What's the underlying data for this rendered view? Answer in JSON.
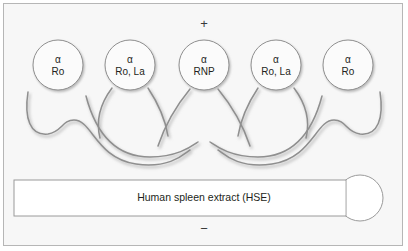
{
  "figure": {
    "title_sign_top": "+",
    "title_sign_bottom": "−",
    "background_color": "#f7f7f7",
    "border_color": "#b6b6b6",
    "line_color": "#8a8a8a",
    "text_color": "#231f20"
  },
  "antibodies": [
    {
      "greek": "α",
      "spec": "Ro",
      "cx": 58,
      "cy": 65,
      "r": 25
    },
    {
      "greek": "α",
      "spec": "Ro, La",
      "cx": 130,
      "cy": 65,
      "r": 25
    },
    {
      "greek": "α",
      "spec": "RNP",
      "cx": 204,
      "cy": 65,
      "r": 25
    },
    {
      "greek": "α",
      "spec": "Ro, La",
      "cx": 276,
      "cy": 65,
      "r": 25
    },
    {
      "greek": "α",
      "spec": "Ro",
      "cx": 348,
      "cy": 65,
      "r": 25
    }
  ],
  "substrate": {
    "label": "Human spleen extract (HSE)",
    "bar_fill": "#ffffff",
    "bulb_fill": "#ffffff"
  }
}
